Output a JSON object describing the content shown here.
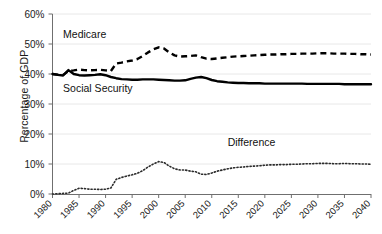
{
  "chart_data": {
    "type": "line",
    "title": "",
    "xlabel": "",
    "ylabel": "Percentage of GDP",
    "xlim": [
      1980,
      2040
    ],
    "ylim": [
      0,
      60
    ],
    "grid": true,
    "legend_position": "inline-annotations",
    "ytick_labels": [
      "0%",
      "10%",
      "20%",
      "30%",
      "40%",
      "50%",
      "60%"
    ],
    "ytick_values": [
      0,
      10,
      20,
      30,
      40,
      50,
      60
    ],
    "xtick_labels": [
      "1980",
      "1985",
      "1990",
      "1995",
      "2000",
      "2005",
      "2010",
      "2015",
      "2020",
      "2025",
      "2030",
      "2035",
      "2040"
    ],
    "xtick_values": [
      1980,
      1985,
      1990,
      1995,
      2000,
      2005,
      2010,
      2015,
      2020,
      2025,
      2030,
      2035,
      2040
    ],
    "x": [
      1980,
      1981,
      1982,
      1983,
      1984,
      1985,
      1986,
      1987,
      1988,
      1989,
      1990,
      1991,
      1992,
      1993,
      1994,
      1995,
      1996,
      1997,
      1998,
      1999,
      2000,
      2001,
      2002,
      2003,
      2004,
      2005,
      2006,
      2007,
      2008,
      2009,
      2010,
      2011,
      2012,
      2013,
      2014,
      2015,
      2016,
      2017,
      2018,
      2019,
      2020,
      2021,
      2022,
      2023,
      2024,
      2025,
      2026,
      2027,
      2028,
      2029,
      2030,
      2031,
      2032,
      2033,
      2034,
      2035,
      2036,
      2037,
      2038,
      2039,
      2040
    ],
    "series": [
      {
        "name": "Medicare",
        "style": "dashed",
        "color": "#000000",
        "values": [
          40.0,
          39.8,
          39.7,
          41.0,
          41.2,
          41.5,
          41.3,
          41.2,
          41.3,
          41.4,
          41.2,
          41.0,
          43.5,
          43.8,
          44.2,
          44.5,
          45.0,
          46.0,
          47.2,
          48.2,
          48.9,
          48.5,
          47.2,
          46.2,
          45.8,
          45.9,
          46.0,
          46.2,
          45.6,
          45.1,
          45.0,
          45.2,
          45.4,
          45.6,
          45.8,
          45.9,
          46.0,
          46.1,
          46.2,
          46.3,
          46.4,
          46.5,
          46.5,
          46.6,
          46.6,
          46.7,
          46.7,
          46.8,
          46.8,
          46.8,
          46.9,
          46.9,
          46.9,
          46.8,
          46.8,
          46.8,
          46.7,
          46.7,
          46.6,
          46.6,
          46.5
        ]
      },
      {
        "name": "Social Security",
        "style": "solid",
        "color": "#000000",
        "values": [
          40.0,
          39.7,
          39.5,
          41.3,
          40.0,
          39.6,
          39.5,
          39.6,
          39.7,
          39.9,
          39.6,
          39.0,
          38.6,
          38.3,
          38.2,
          38.1,
          38.1,
          38.2,
          38.2,
          38.2,
          38.1,
          38.0,
          37.9,
          37.8,
          37.8,
          37.9,
          38.4,
          38.8,
          39.0,
          38.6,
          38.0,
          37.6,
          37.4,
          37.2,
          37.1,
          37.0,
          37.0,
          36.9,
          36.9,
          36.9,
          36.8,
          36.8,
          36.8,
          36.8,
          36.8,
          36.8,
          36.8,
          36.8,
          36.7,
          36.7,
          36.7,
          36.7,
          36.7,
          36.7,
          36.7,
          36.6,
          36.6,
          36.6,
          36.6,
          36.6,
          36.6
        ]
      },
      {
        "name": "Difference",
        "style": "dotted",
        "color": "#2b2b2b",
        "values": [
          0.0,
          0.1,
          0.2,
          0.3,
          1.2,
          1.9,
          1.8,
          1.6,
          1.6,
          1.5,
          1.6,
          2.0,
          4.9,
          5.5,
          6.0,
          6.4,
          6.9,
          7.8,
          9.0,
          10.0,
          10.8,
          10.5,
          9.3,
          8.4,
          8.0,
          8.0,
          7.6,
          7.4,
          6.6,
          6.5,
          7.0,
          7.6,
          8.0,
          8.4,
          8.7,
          8.9,
          9.0,
          9.2,
          9.3,
          9.4,
          9.6,
          9.7,
          9.7,
          9.8,
          9.8,
          9.9,
          9.9,
          10.0,
          10.1,
          10.1,
          10.2,
          10.2,
          10.2,
          10.1,
          10.1,
          10.2,
          10.1,
          10.1,
          10.0,
          10.0,
          9.9
        ]
      }
    ],
    "annotations": [
      {
        "text": "Medicare",
        "x": 1982,
        "y": 52,
        "name": "medicare-label"
      },
      {
        "text": "Social Security",
        "x": 1982,
        "y": 34,
        "name": "social-security-label"
      },
      {
        "text": "Difference",
        "x": 2013,
        "y": 16,
        "name": "difference-label"
      }
    ]
  }
}
